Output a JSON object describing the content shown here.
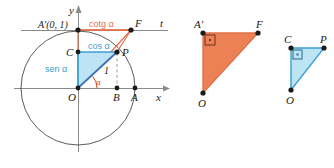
{
  "figure": {
    "title_alt": "Unit circle trigonometric ratios diagram",
    "colors": {
      "orange_fill": "#ec8156",
      "orange_stroke": "#e0714a",
      "blue_fill": "#bde4f4",
      "blue_stroke": "#3a9fd4",
      "dark_blue_stroke": "#3f6fb5",
      "axis": "#8a8a8a",
      "circle": "#4a4a4a",
      "point": "#1a1a1a",
      "red_angle": "#d4452a"
    }
  },
  "left_diagram": {
    "name": "unit-circle",
    "axis_x_label": "x",
    "axis_y_label": "y",
    "tangent_line_label": "t",
    "points": {
      "O": "O",
      "A": "A",
      "B": "B",
      "C": "C",
      "P": "P",
      "F": "F",
      "A_prime": "A'(0, 1)"
    },
    "segment_labels": {
      "cotangent": "cotg α",
      "cosine": "cos α",
      "sine": "sen α",
      "radius": "1",
      "angle": "α"
    }
  },
  "middle_diagram": {
    "name": "triangle-OA-prime-F",
    "points": {
      "A_prime": "A'",
      "F": "F",
      "O": "O"
    },
    "right_angle_at": "A'"
  },
  "right_diagram": {
    "name": "triangle-OCP",
    "points": {
      "C": "C",
      "P": "P",
      "O": "O"
    },
    "right_angle_at": "C"
  }
}
